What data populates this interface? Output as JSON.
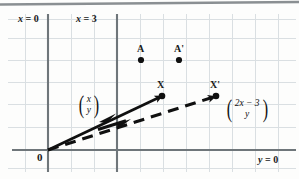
{
  "figure": {
    "colors": {
      "grid": "#d8dde0",
      "axis": "#6f767a",
      "vector": "#101010",
      "top_rule": "#8a8f92",
      "background": "#fdfdfc"
    }
  },
  "axis_labels": {
    "x_zero": {
      "var": "x",
      "eq": "=",
      "val": "0"
    },
    "x_three": {
      "var": "x",
      "eq": "=",
      "val": "3"
    },
    "y_zero": {
      "var": "y",
      "eq": "=",
      "val": "0"
    },
    "origin": "0"
  },
  "points": [
    {
      "name": "A",
      "label": "A",
      "x": 141,
      "y": 60
    },
    {
      "name": "A-prime",
      "label": "A'",
      "x": 179,
      "y": 60
    },
    {
      "name": "X",
      "label": "X",
      "x": 162,
      "y": 96
    },
    {
      "name": "X-prime",
      "label": "X'",
      "x": 216,
      "y": 96
    }
  ],
  "vectors": [
    {
      "name": "OX",
      "style": "solid",
      "from": [
        48,
        150
      ],
      "to": [
        162,
        96
      ],
      "label_top": "x",
      "label_bottom": "y"
    },
    {
      "name": "OX-prime",
      "style": "dashed",
      "from": [
        48,
        150
      ],
      "to": [
        216,
        96
      ],
      "label_top": "2x − 3",
      "label_bottom": "y"
    }
  ],
  "vector_labels": {
    "left": {
      "top": "x",
      "bottom": "y"
    },
    "right": {
      "top": "2x − 3",
      "bottom": "y"
    }
  },
  "grid": {
    "spacing": 23,
    "x_origin": 48,
    "y_origin": 150,
    "x_three_line": 117
  }
}
